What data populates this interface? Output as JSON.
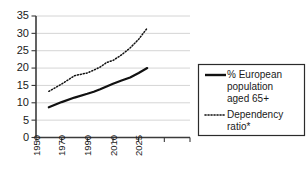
{
  "chart_data": {
    "type": "line",
    "title": "",
    "subtitle": "",
    "xlabel": "",
    "ylabel": "",
    "xlim_labels": [
      "1950",
      "1970",
      "1990",
      "2010",
      "2025"
    ],
    "x_tick_labels": [
      "1950",
      "1970",
      "1990",
      "2010",
      "2025"
    ],
    "x_tick_count": 7,
    "y_tick_labels": [
      "0",
      "5",
      "10",
      "15",
      "20",
      "25",
      "30",
      "35"
    ],
    "ylim": [
      0,
      35
    ],
    "ytick_step": 5,
    "grid": "horizontal",
    "legend_position": "right-outside",
    "x": [
      1960,
      1970,
      1980,
      1990,
      1995,
      2000,
      2005,
      2010,
      2015,
      2020,
      2025,
      2030
    ],
    "series": [
      {
        "name": "% European population aged 65+",
        "style": "solid",
        "color": "#111111",
        "values": [
          8.7,
          10.2,
          11.5,
          12.6,
          13.2,
          13.9,
          14.7,
          15.5,
          16.4,
          17.3,
          18.6,
          20.0
        ]
      },
      {
        "name": "Dependency ratio*",
        "style": "dotted",
        "color": "#111111",
        "values": [
          13.3,
          15.4,
          17.8,
          18.6,
          19.4,
          20.3,
          21.6,
          22.2,
          23.8,
          25.8,
          28.3,
          31.5
        ]
      }
    ],
    "legend": [
      {
        "label": "% European population aged 65+",
        "style": "solid"
      },
      {
        "label": "Dependency ratio*",
        "style": "dotted"
      }
    ],
    "legend_lines": {
      "series1": [
        "% European",
        "population",
        "aged 65+"
      ],
      "series2": [
        "Dependency",
        "ratio*"
      ]
    },
    "colors": {
      "axis": "#3b3b3b",
      "grid": "#c9c9c9",
      "line": "#111111",
      "text": "#1a1a1a",
      "background": "#ffffff",
      "legend_border": "#2b2b2b"
    }
  }
}
